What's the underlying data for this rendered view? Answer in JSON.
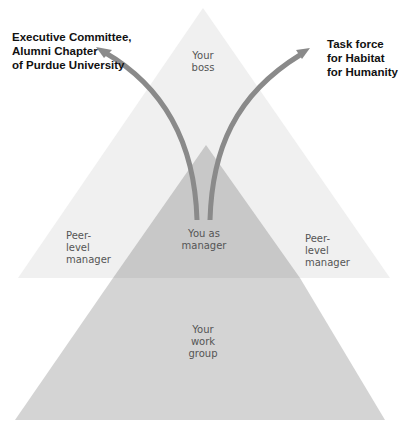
{
  "diagram": {
    "colors": {
      "background": "#ffffff",
      "upper_triangle": "#f0f0f0",
      "overlap": "#c8c8c8",
      "work_group": "#d4d4d4",
      "arrow": "#8a8a8a",
      "label_text": "#555555",
      "external_text": "#111111"
    },
    "nodes": {
      "boss": "Your\nboss",
      "peer_left": "Peer-\nlevel\nmanager",
      "you": "You as\nmanager",
      "peer_right": "Peer-\nlevel\nmanager",
      "work_group": "Your\nwork\ngroup"
    },
    "external": {
      "left": "Executive Committee,\nAlumni Chapter\nof Purdue University",
      "right": "Task force\nfor Habitat\nfor Humanity"
    },
    "edges": [
      {
        "from": "You as manager",
        "to": "Executive Committee, Alumni Chapter of Purdue University"
      },
      {
        "from": "You as manager",
        "to": "Task force for Habitat for Humanity"
      }
    ]
  }
}
